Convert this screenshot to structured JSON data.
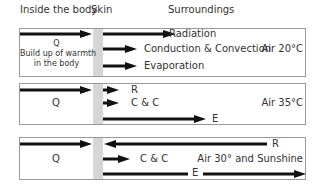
{
  "headers": {
    "inside": "Inside the body",
    "skin": "Skin",
    "surroundings": "Surroundings"
  },
  "panels": [
    {
      "condition": "Air 20°C",
      "q_label": "Q",
      "q_note_line1": "Build up of warmth",
      "q_note_line2": "in the body",
      "radiation": "Radiation",
      "convection": "Conduction & Convection",
      "evaporation": "Evaporation"
    },
    {
      "condition": "Air 35°C",
      "q_label": "Q",
      "radiation": "R",
      "convection": "C & C",
      "evaporation": "E"
    },
    {
      "condition": "Air 30° and Sunshine",
      "q_label": "Q",
      "radiation": "R",
      "convection": "C & C",
      "evaporation": "E"
    }
  ],
  "colors": {
    "arrow": "#111111",
    "skin": "#d6d6d6",
    "border": "#999999"
  }
}
